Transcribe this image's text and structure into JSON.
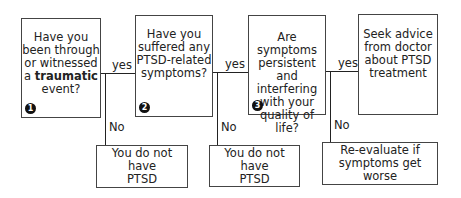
{
  "questions": [
    {
      "number": "1",
      "line1": "Have you",
      "line2": "been through",
      "line3": "or witnessed",
      "line4_pre": "a ",
      "line4_bold": "traumatic",
      "line5": "event?"
    },
    {
      "number": "2",
      "line1": "Have you",
      "line2": "suffered any",
      "line3": "PTSD-related",
      "line4": "symptoms?"
    },
    {
      "number": "3",
      "line1": "Are symptoms",
      "line2": "persistent and",
      "line3": "interfering",
      "line4": "with your",
      "line5": "quality of",
      "line6": "life?"
    }
  ],
  "final": {
    "line1": "Seek advice",
    "line2": "from doctor",
    "line3": "about PTSD",
    "line4": "treatment"
  },
  "labels": {
    "yes": "yes",
    "no": "No"
  },
  "outcomes": [
    {
      "line1": "You do not have",
      "line2": "PTSD"
    },
    {
      "line1": "You do not have",
      "line2": "PTSD"
    },
    {
      "line1": "Re-evaluate if",
      "line2": "symptoms get worse"
    }
  ]
}
